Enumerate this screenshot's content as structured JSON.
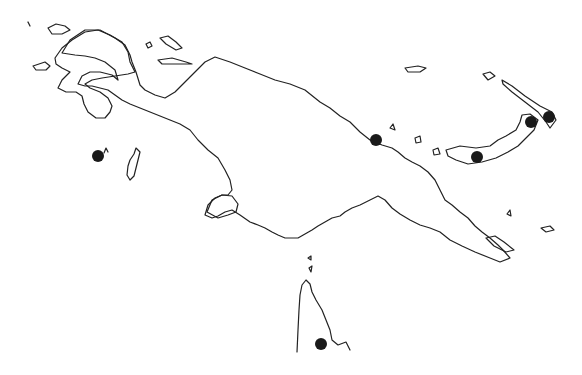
{
  "map": {
    "background": "#ffffff",
    "stroke_color": "#222222",
    "marker_color": "#1a1a1a",
    "region": "New Guinea and surrounding islands (outline map)",
    "markers": [
      {
        "id": "west-island",
        "x": 98,
        "y": 156,
        "r": 6
      },
      {
        "id": "north-coast",
        "x": 376,
        "y": 140,
        "r": 6
      },
      {
        "id": "new-britain-west",
        "x": 477,
        "y": 157,
        "r": 6
      },
      {
        "id": "new-britain-east",
        "x": 531,
        "y": 122,
        "r": 6
      },
      {
        "id": "new-ireland",
        "x": 549,
        "y": 117,
        "r": 6
      },
      {
        "id": "cape-york",
        "x": 321,
        "y": 344,
        "r": 6
      }
    ]
  }
}
